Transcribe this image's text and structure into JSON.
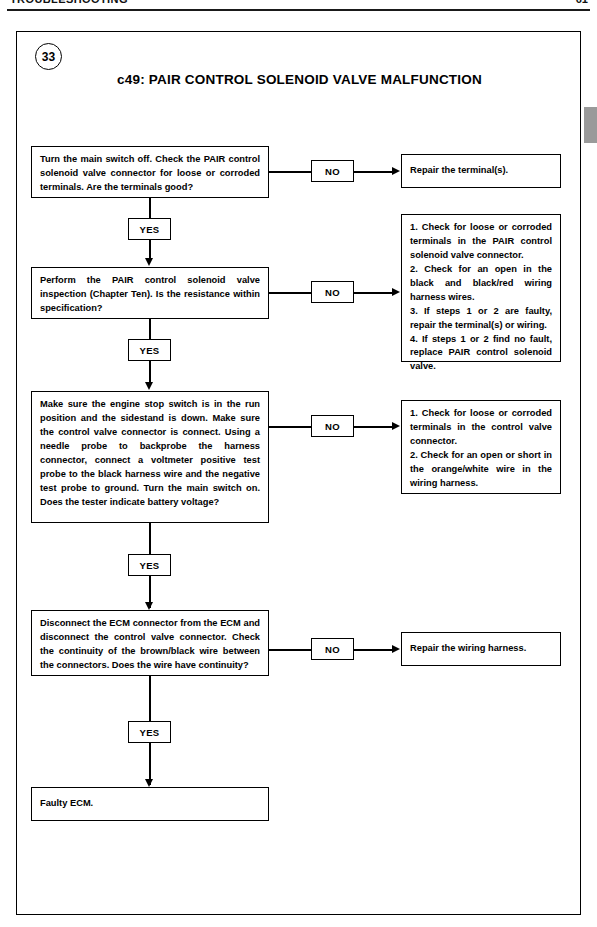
{
  "header": {
    "title": "TROUBLESHOOTING",
    "folio": "61"
  },
  "chart": {
    "step_number": "33",
    "title": "c49: PAIR CONTROL SOLENOID VALVE MALFUNCTION",
    "yes_label": "YES",
    "no_label": "NO",
    "nodes": {
      "q1": "Turn the main switch off. Check the PAIR control solenoid valve connector for loose or corroded terminals. Are the terminals good?",
      "r1": "Repair the terminal(s).",
      "q2": "Perform the PAIR control solenoid valve inspection (Chapter Ten). Is the resistance within specification?",
      "r2_item1": "1. Check for loose or corroded terminals in the PAIR control solenoid valve connector.",
      "r2_item2": "2. Check for an open in the black and black/red wiring harness wires.",
      "r2_item3": "3. If steps 1 or 2 are faulty, repair the terminal(s) or wiring.",
      "r2_item4": "4. If steps 1 or 2 find no fault, replace PAIR control solenoid valve.",
      "q3": "Make sure the engine stop switch is in the run position and the sidestand is down. Make sure the control valve connector is connect. Using a needle probe to backprobe the harness connector, connect a voltmeter positive test probe to the black harness wire and the negative test probe to ground. Turn the main switch on. Does the tester indicate battery voltage?",
      "r3_item1": "1. Check for loose or corroded terminals in the control valve connector.",
      "r3_item2": "2. Check for an open or short in the orange/white wire in the wiring harness.",
      "q4": "Disconnect the ECM connector from the ECM and disconnect the control valve connector. Check the continuity of the brown/black wire between the connectors. Does the wire have continuity?",
      "r4": "Repair the wiring harness.",
      "final": "Faulty ECM."
    }
  },
  "colors": {
    "ink": "#000000",
    "paper": "#ffffff",
    "tab": "#9a9a9a"
  }
}
